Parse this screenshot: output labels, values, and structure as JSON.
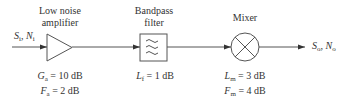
{
  "blocks": {
    "amplifier": {
      "title_line1": "Low noise",
      "title_line2": "amplifier",
      "param1_sym": "G",
      "param1_sub": "a",
      "param1_val": " = 10 dB",
      "param2_sym": "F",
      "param2_sub": "a",
      "param2_val": " = 2 dB"
    },
    "filter": {
      "title_line1": "Bandpass",
      "title_line2": "filter",
      "param1_sym": "L",
      "param1_sub": "f",
      "param1_val": " = 1 dB"
    },
    "mixer": {
      "title": "Mixer",
      "param1_sym": "L",
      "param1_sub": "m",
      "param1_val": " = 3 dB",
      "param2_sym": "F",
      "param2_sub": "m",
      "param2_val": " = 4 dB"
    }
  },
  "input": {
    "s": "S",
    "s_sub": "i",
    "sep": ", ",
    "n": "N",
    "n_sub": "i"
  },
  "output": {
    "s": "S",
    "s_sub": "o",
    "sep": ", ",
    "n": "N",
    "n_sub": "o"
  }
}
